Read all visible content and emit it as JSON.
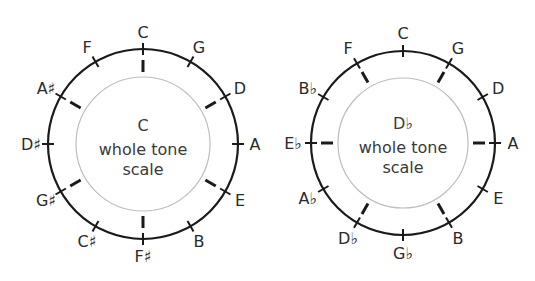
{
  "diagrams": [
    {
      "title_lines": [
        "C",
        "whole tone",
        "scale"
      ],
      "outer_labels": [
        "C",
        "G",
        "D",
        "A",
        "E",
        "B",
        "F♯",
        "C♯",
        "G♯",
        "D♯",
        "A♯",
        "F"
      ],
      "inner_tick_positions": [
        0,
        2,
        4,
        6,
        8,
        10
      ]
    },
    {
      "title_lines": [
        "D♭",
        "whole tone",
        "scale"
      ],
      "outer_labels": [
        "C",
        "G",
        "D",
        "A",
        "E",
        "B",
        "G♭",
        "D♭",
        "A♭",
        "E♭",
        "B♭",
        "F"
      ],
      "inner_tick_positions": [
        1,
        3,
        5,
        7,
        9,
        11
      ]
    }
  ],
  "colors": {
    "outer_circle": "#1a1a1a",
    "inner_circle": "#bdbdbd",
    "text": "#2a2a2a"
  }
}
